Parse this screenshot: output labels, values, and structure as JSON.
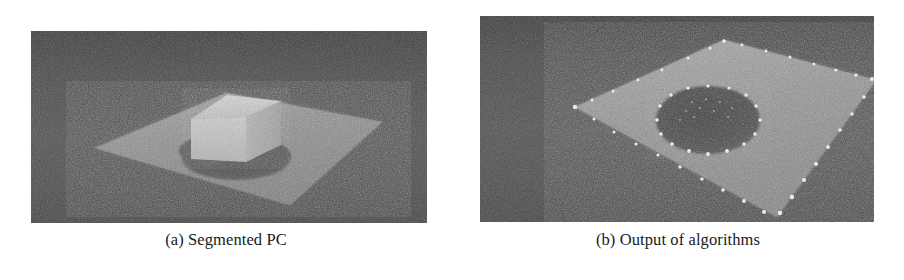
{
  "figure": {
    "kind": "two-panel point-cloud result figure",
    "background_color": "#ffffff"
  },
  "subfigures": [
    {
      "id": "a",
      "caption": "(a) Segmented PC",
      "panel": {
        "backdrop_color": "#4a4a4a",
        "plane_color": "#8d8d8d",
        "box_color": "#c9c9c9",
        "hole_color": "#545454",
        "description": "Noisy 3D point cloud: a large quadrilateral ground plane seen in perspective with a bright cuboid box standing on it and a dark segmented blob/hole region in front of the box"
      }
    },
    {
      "id": "b",
      "caption": "(b) Output of algorithms",
      "panel": {
        "backdrop_color": "#4d4d4d",
        "plane_color": "#909090",
        "hole_color": "#4a4a4a",
        "marker_color": "#f2f2f2",
        "description": "Same scene after processing: the ground plane remains, its four boundary edges are traced by bright white detected points and a circular hole in the plane is outlined by bright white boundary points"
      }
    }
  ]
}
